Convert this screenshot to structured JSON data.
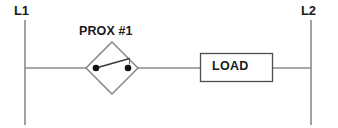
{
  "diagram": {
    "type": "ladder-logic-schematic",
    "background_color": "#ffffff",
    "line_color": "#8a8a8a",
    "symbol_color": "#6f6f6f",
    "contact_color": "#1a1a1a",
    "text_color": "#1a1a1a"
  },
  "rails": {
    "left": {
      "label": "L1",
      "x": 25,
      "y_top": 20,
      "y_bottom": 125
    },
    "right": {
      "label": "L2",
      "x": 311,
      "y_top": 20,
      "y_bottom": 125
    }
  },
  "rung": {
    "y": 68,
    "segments": [
      {
        "name": "left-rail-to-switch",
        "x1": 25,
        "x2": 86
      },
      {
        "name": "switch-to-load",
        "x1": 138,
        "x2": 200
      },
      {
        "name": "load-to-right-rail",
        "x1": 273,
        "x2": 311
      }
    ]
  },
  "components": [
    {
      "name": "proximity-switch",
      "label": "PROX #1",
      "symbol": "normally-open-proximity-contact-in-diamond",
      "shape": "diamond",
      "center_x": 112,
      "center_y": 68,
      "half_width": 26,
      "half_height": 26,
      "contacts": [
        {
          "name": "left-contact-dot",
          "x": 96,
          "y": 68,
          "r": 3.2
        },
        {
          "name": "right-contact-dot",
          "x": 128,
          "y": 68,
          "r": 3.2
        }
      ],
      "blade": {
        "x1": 96,
        "y1": 68,
        "x2": 129,
        "y2": 59
      }
    },
    {
      "name": "load",
      "label": "LOAD",
      "symbol": "rectangle-box",
      "x": 200,
      "y": 53,
      "width": 73,
      "height": 28
    }
  ]
}
